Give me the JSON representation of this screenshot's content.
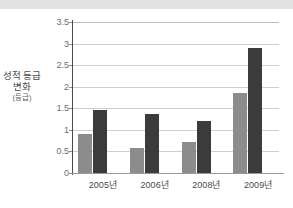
{
  "title": {
    "text": "",
    "truncated": true
  },
  "axis": {
    "ylabel_line1": "성적 등급",
    "ylabel_line2": "변화",
    "ylabel_unit": "(등급)"
  },
  "colors": {
    "series_a": "#8c8c8c",
    "series_b": "#3b3b3b",
    "grid": "#cfcfcf",
    "axis": "#4a4a4a",
    "title_band": "#e2e2e2"
  },
  "chart_data": {
    "type": "bar",
    "title": "",
    "xlabel": "",
    "ylabel": "성적 등급 변화 (등급)",
    "ylim": [
      0,
      3.5
    ],
    "yticks": [
      0,
      0.5,
      1,
      1.5,
      2,
      2.5,
      3,
      3.5
    ],
    "ytick_labels": [
      "0",
      "0.5",
      "1",
      "1.5",
      "2",
      "2.5",
      "3",
      "3.5"
    ],
    "grid": true,
    "grid_axis": "y",
    "legend": false,
    "categories": [
      "2005년",
      "2006년",
      "2008년",
      "2009년"
    ],
    "series": [
      {
        "name": "series-a",
        "color": "#8c8c8c",
        "values": [
          0.9,
          0.57,
          0.72,
          1.86
        ]
      },
      {
        "name": "series-b",
        "color": "#3b3b3b",
        "values": [
          1.45,
          1.37,
          1.2,
          2.9
        ]
      }
    ]
  }
}
